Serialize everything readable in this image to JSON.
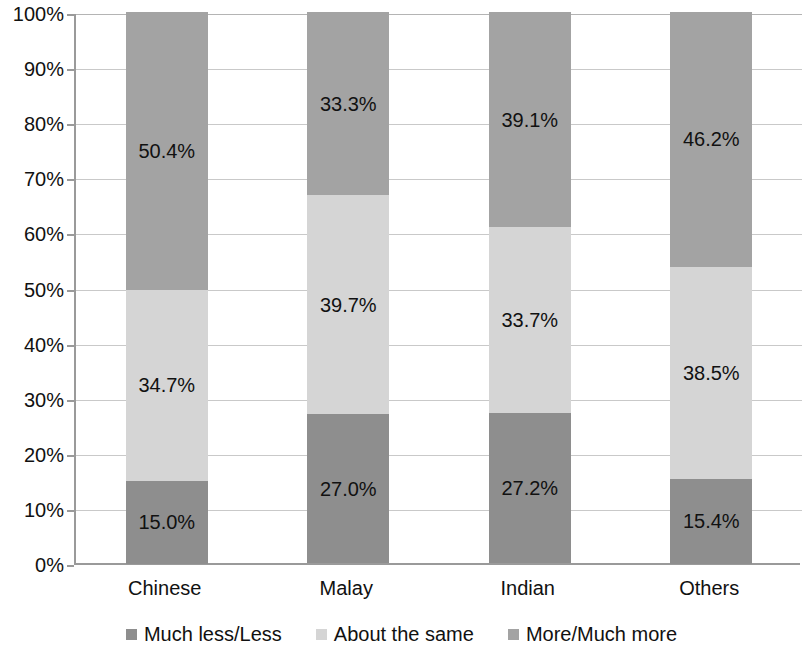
{
  "chart_data": {
    "type": "bar",
    "subtype": "stacked-percent",
    "title": "",
    "xlabel": "",
    "ylabel": "",
    "ylim": [
      0,
      100
    ],
    "grid": true,
    "legend_position": "bottom",
    "categories": [
      "Chinese",
      "Malay",
      "Indian",
      "Others"
    ],
    "y_ticks": [
      "0%",
      "10%",
      "20%",
      "30%",
      "40%",
      "50%",
      "60%",
      "70%",
      "80%",
      "90%",
      "100%"
    ],
    "y_tick_values": [
      0,
      10,
      20,
      30,
      40,
      50,
      60,
      70,
      80,
      90,
      100
    ],
    "series": [
      {
        "name": "Much less/Less",
        "color": "#8e8e8e",
        "values": [
          15.0,
          27.0,
          27.2,
          15.4
        ],
        "labels": [
          "15.0%",
          "27.0%",
          "27.2%",
          "15.4%"
        ]
      },
      {
        "name": "About the same",
        "color": "#d5d5d5",
        "values": [
          34.7,
          39.7,
          33.7,
          38.5
        ],
        "labels": [
          "34.7%",
          "39.7%",
          "33.7%",
          "38.5%"
        ]
      },
      {
        "name": "More/Much more",
        "color": "#a3a3a3",
        "values": [
          50.4,
          33.3,
          39.1,
          46.2
        ],
        "labels": [
          "50.4%",
          "33.3%",
          "39.1%",
          "46.2%"
        ]
      }
    ]
  },
  "legend": {
    "items": [
      {
        "label": "Much less/Less",
        "color": "#8e8e8e"
      },
      {
        "label": "About the same",
        "color": "#d5d5d5"
      },
      {
        "label": "More/Much more",
        "color": "#a3a3a3"
      }
    ]
  }
}
